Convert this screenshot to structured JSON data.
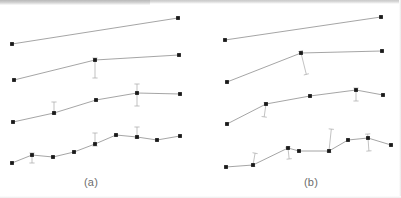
{
  "figure": {
    "background_color": "#ffffff",
    "line_color": "#8e8e8e",
    "marker_color": "#1a1a1a",
    "errorbar_color": "#a8a8a8",
    "label_color": "#6d6d6d",
    "width": 401,
    "height": 198
  },
  "panels": [
    {
      "id": "a",
      "label": "(a)",
      "label_x": 84,
      "label_y": 176
    },
    {
      "id": "b",
      "label": "(b)",
      "label_x": 304,
      "label_y": 176
    }
  ],
  "chart_data": {
    "type": "line",
    "title": "",
    "subtitle": "",
    "xlabel": "",
    "ylabel": "",
    "grid": false,
    "legend": "none",
    "axes_visible": false,
    "tick_labels": [],
    "panel_labels": [
      "(a)",
      "(b)"
    ],
    "annotations": [],
    "panels": [
      {
        "name": "(a)",
        "xlim": [
          0,
          190
        ],
        "ylim": [
          198,
          0
        ],
        "series": [
          {
            "name": "a-series-1",
            "n_points": 2,
            "x": [
              12,
              178
            ],
            "y": [
              44,
              18
            ],
            "errorbars": []
          },
          {
            "name": "a-series-2",
            "n_points": 3,
            "x": [
              14,
              95,
              179
            ],
            "y": [
              80,
              60,
              55
            ],
            "errorbars": [
              {
                "index": 1,
                "x": 95,
                "y": 60,
                "lower": 18,
                "upper": 2,
                "tilt": 0
              }
            ]
          },
          {
            "name": "a-series-3",
            "n_points": 5,
            "x": [
              13,
              54,
              96,
              137,
              180
            ],
            "y": [
              122,
              113,
              100,
              93,
              94
            ],
            "errorbars": [
              {
                "index": 1,
                "x": 54,
                "y": 113,
                "lower": 1,
                "upper": 11,
                "tilt": 0
              },
              {
                "index": 3,
                "x": 137,
                "y": 93,
                "lower": 13,
                "upper": 9,
                "tilt": 0
              }
            ]
          },
          {
            "name": "a-series-4",
            "n_points": 9,
            "x": [
              12,
              32,
              53,
              74,
              95,
              116,
              137,
              157,
              180
            ],
            "y": [
              163,
              155,
              157,
              152,
              144,
              135,
              137,
              140,
              136
            ],
            "errorbars": [
              {
                "index": 1,
                "x": 32,
                "y": 155,
                "lower": 8,
                "upper": 2,
                "tilt": 0
              },
              {
                "index": 4,
                "x": 95,
                "y": 144,
                "lower": 2,
                "upper": 11,
                "tilt": 0
              },
              {
                "index": 6,
                "x": 137,
                "y": 137,
                "lower": 1,
                "upper": 10,
                "tilt": 0
              }
            ]
          }
        ]
      },
      {
        "name": "(b)",
        "xlim": [
          210,
          400
        ],
        "ylim": [
          198,
          0
        ],
        "series": [
          {
            "name": "b-series-1",
            "n_points": 2,
            "x": [
              225,
              381
            ],
            "y": [
              40,
              17
            ],
            "errorbars": []
          },
          {
            "name": "b-series-2",
            "n_points": 3,
            "x": [
              227,
              301,
              382
            ],
            "y": [
              82,
              53,
              51
            ],
            "errorbars": [
              {
                "index": 1,
                "x": 301,
                "y": 53,
                "lower": 22,
                "upper": 2,
                "tilt": 14
              }
            ]
          },
          {
            "name": "b-series-3",
            "n_points": 5,
            "x": [
              227,
              266,
              310,
              356,
              383
            ],
            "y": [
              124,
              104,
              96,
              90,
              95
            ],
            "errorbars": [
              {
                "index": 1,
                "x": 266,
                "y": 104,
                "lower": 13,
                "upper": 1,
                "tilt": -8
              },
              {
                "index": 3,
                "x": 356,
                "y": 90,
                "lower": 11,
                "upper": 2,
                "tilt": 0
              }
            ]
          },
          {
            "name": "b-series-4",
            "n_points": 8,
            "x": [
              226,
              253,
              288,
              299,
              329,
              348,
              368,
              391
            ],
            "y": [
              167,
              165,
              148,
              151,
              151,
              140,
              138,
              145
            ],
            "errorbars": [
              {
                "index": 1,
                "x": 253,
                "y": 165,
                "lower": 1,
                "upper": 12,
                "tilt": -10
              },
              {
                "index": 2,
                "x": 288,
                "y": 148,
                "lower": 11,
                "upper": 1,
                "tilt": 6
              },
              {
                "index": 4,
                "x": 329,
                "y": 151,
                "lower": 1,
                "upper": 22,
                "tilt": -6
              },
              {
                "index": 6,
                "x": 368,
                "y": 138,
                "lower": 13,
                "upper": 4,
                "tilt": 4
              }
            ]
          }
        ]
      }
    ]
  }
}
